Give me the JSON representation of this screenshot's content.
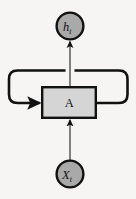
{
  "diagram": {
    "type": "rnn-unrolled-cell",
    "background_color": "#f6f5f3",
    "stroke_color": "#111111",
    "nodes": [
      {
        "id": "output",
        "shape": "circle",
        "label": "h",
        "subscript": "t",
        "fill_color": "#a9a9a9",
        "center_x": 70,
        "center_y": 26,
        "radius": 13.5
      },
      {
        "id": "cell",
        "shape": "rectangle",
        "label": "A",
        "subscript": "",
        "fill_color": "#d5d5d5",
        "x": 42,
        "y": 87,
        "width": 54,
        "height": 31
      },
      {
        "id": "input",
        "shape": "circle",
        "label": "X",
        "subscript": "t",
        "fill_color": "#a9a9a9",
        "center_x": 70,
        "center_y": 174,
        "radius": 13.5
      }
    ],
    "edges": [
      {
        "id": "input-to-cell",
        "from": "input",
        "to": "cell",
        "style": "straight-vertical",
        "arrow": true
      },
      {
        "id": "cell-to-output",
        "from": "cell",
        "to": "output",
        "style": "straight-vertical",
        "arrow": true
      },
      {
        "id": "recurrent-loop",
        "from": "cell",
        "to": "cell",
        "style": "rounded-loop-over-top",
        "arrow": true
      }
    ]
  }
}
